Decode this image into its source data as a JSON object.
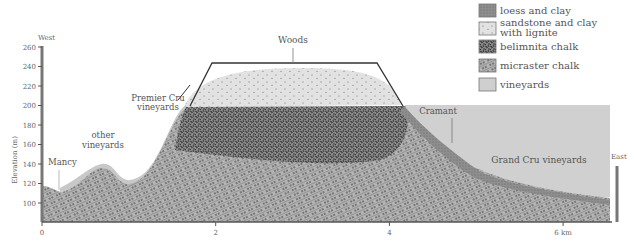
{
  "axis": {
    "ylabel": "Elevation (m)",
    "y_ticks": [
      "260",
      "240",
      "220",
      "200",
      "180",
      "160",
      "140",
      "120",
      "100"
    ],
    "x_ticks": [
      "0",
      "2",
      "4",
      "6 km"
    ],
    "west_label": "West",
    "east_label": "East"
  },
  "labels": {
    "woods": "Woods",
    "premier_cru_1": "Premier Cru",
    "premier_cru_2": "vineyards",
    "other_1": "other",
    "other_2": "vineyards",
    "mancy": "Mancy",
    "cramant": "Cramant",
    "grand_cru": "Grand Cru vineyards"
  },
  "legend": [
    {
      "label": "loess and clay",
      "color": "#8a8a8a"
    },
    {
      "label": "sandstone and clay",
      "label2": "with lignite",
      "color": "#e6e6e6"
    },
    {
      "label": "belimnita chalk",
      "color": "#6a6a6a"
    },
    {
      "label": "micraster chalk",
      "color": "#9a9a9a"
    },
    {
      "label": "vineyards",
      "color": "#c8c8c8"
    }
  ],
  "colors": {
    "vineyards": "#cfcfcf",
    "sandstone": "#e4e4e4",
    "belimnita": "#5f5f5f",
    "micraster": "#a0a0a0",
    "loess": "#8d8d8d",
    "axis": "#777777"
  }
}
